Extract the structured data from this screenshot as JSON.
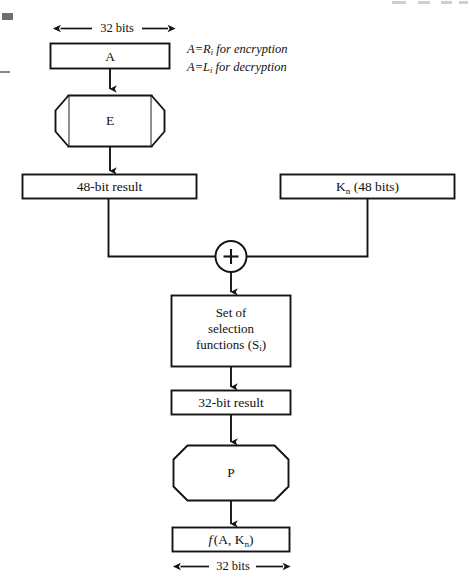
{
  "figure": {
    "line_color": "#141414",
    "fill_color": "#ffffff",
    "background": "#ffffff"
  },
  "dimension_labels": {
    "top": "32 bits",
    "bottom": "32 bits"
  },
  "annotation": {
    "line1_prefix": "A=R",
    "line1_sub": "i",
    "line1_suffix": " for encryption",
    "line2_prefix": "A=L",
    "line2_sub": "i",
    "line2_suffix": " for decryption"
  },
  "nodes": {
    "input_a": {
      "label": "A"
    },
    "expansion": {
      "label": "E"
    },
    "expanded_result": {
      "label": "48-bit result"
    },
    "subkey": {
      "label_prefix": "K",
      "label_sub": "n",
      "label_suffix": " (48 bits)"
    },
    "xor": {
      "label": "+",
      "name": "exclusive-or"
    },
    "selection": {
      "line1": "Set of",
      "line2": "selection",
      "line3_prefix": "functions (S",
      "line3_sub": "i",
      "line3_suffix": ")"
    },
    "sbox_result": {
      "label": "32-bit result"
    },
    "permutation": {
      "label": "P"
    },
    "output": {
      "label_f": "f",
      "label_rest_prefix": "(A, K",
      "label_rest_sub": "n",
      "label_rest_suffix": ")"
    }
  }
}
